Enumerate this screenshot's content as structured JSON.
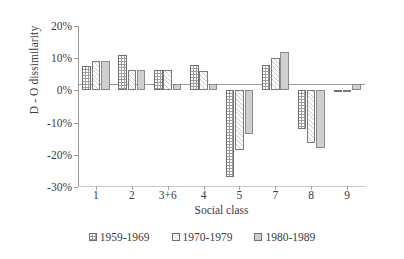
{
  "chart_data": {
    "type": "bar",
    "title": "",
    "xlabel": "Social class",
    "ylabel": "D - O dissimilarity",
    "categories": [
      "1",
      "2",
      "3+6",
      "4",
      "5",
      "7",
      "8",
      "9"
    ],
    "ylim": [
      -30,
      20
    ],
    "ytick_labels": [
      "20%",
      "10%",
      "0%",
      "-10%",
      "-20%",
      "-30%"
    ],
    "ytick_values": [
      20,
      10,
      0,
      -10,
      -20,
      -30
    ],
    "grid": false,
    "legend_position": "bottom",
    "series": [
      {
        "name": "1959-1969",
        "swatch": "dark-dotted",
        "color": "#9d9d9d",
        "values": [
          7.5,
          11.0,
          6.5,
          8.0,
          -27.0,
          8.0,
          -12.0,
          0.0
        ]
      },
      {
        "name": "1970-1979",
        "swatch": "white-hatched",
        "color": "#fbfbfb",
        "values": [
          9.0,
          6.5,
          6.5,
          6.0,
          -18.5,
          10.0,
          -16.5,
          -0.5
        ]
      },
      {
        "name": "1980-1989",
        "swatch": "solid-light-grey",
        "color": "#cfcfcf",
        "values": [
          9.0,
          6.5,
          2.0,
          2.0,
          -13.5,
          12.0,
          -18.0,
          2.0
        ]
      }
    ]
  }
}
